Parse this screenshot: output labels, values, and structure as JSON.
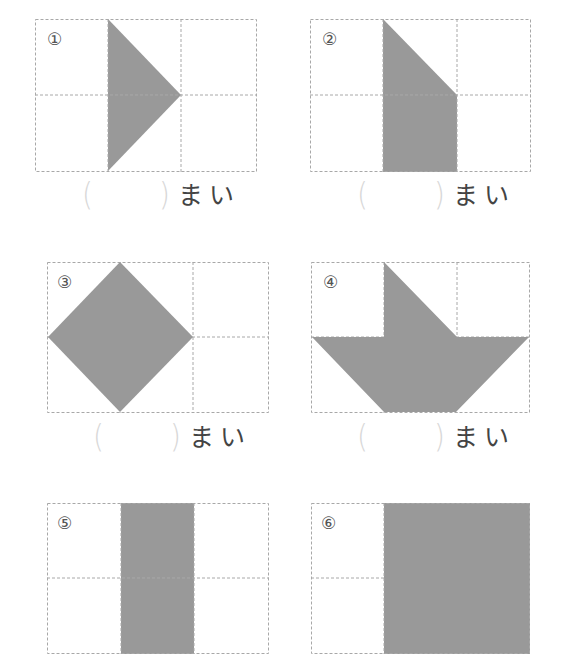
{
  "worksheet": {
    "fill_color": "#999999",
    "grid_line_color": "#a8a8a8",
    "problems": [
      {
        "number": "①",
        "grid": {
          "cols": 3,
          "rows": 2
        },
        "shape": "triangle",
        "answer_open": "(",
        "answer_close": ")",
        "unit": "まい"
      },
      {
        "number": "②",
        "grid": {
          "cols": 3,
          "rows": 2
        },
        "shape": "trapezoid",
        "answer_open": "(",
        "answer_close": ")",
        "unit": "まい"
      },
      {
        "number": "③",
        "grid": {
          "cols": 3,
          "rows": 2
        },
        "shape": "diamond",
        "answer_open": "(",
        "answer_close": ")",
        "unit": "まい"
      },
      {
        "number": "④",
        "grid": {
          "cols": 3,
          "rows": 2
        },
        "shape": "boat",
        "answer_open": "(",
        "answer_close": ")",
        "unit": "まい"
      },
      {
        "number": "⑤",
        "grid": {
          "cols": 3,
          "rows": 2
        },
        "shape": "rectangle-column",
        "answer_open": "(",
        "answer_close": ")",
        "unit": "まい"
      },
      {
        "number": "⑥",
        "grid": {
          "cols": 3,
          "rows": 2
        },
        "shape": "rectangle-wide",
        "answer_open": "(",
        "answer_close": ")",
        "unit": "まい"
      }
    ]
  }
}
